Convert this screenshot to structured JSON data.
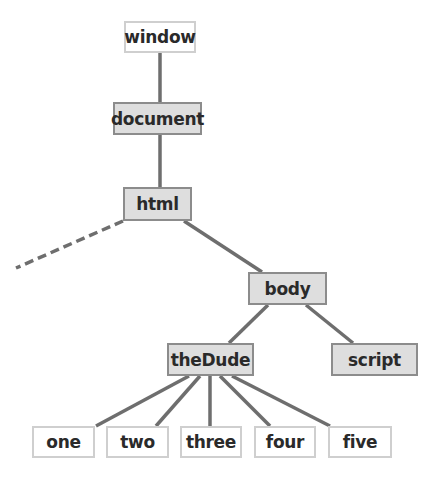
{
  "diagram": {
    "type": "tree",
    "colors": {
      "shaded_fill": "#dedede",
      "shaded_border": "#8c8c8c",
      "plain_fill": "#ffffff",
      "plain_border": "#cfcfcf",
      "edge": "#6e6e6e"
    },
    "nodes": {
      "window": {
        "label": "window",
        "style": "plain"
      },
      "document": {
        "label": "document",
        "style": "shaded"
      },
      "html": {
        "label": "html",
        "style": "shaded"
      },
      "body": {
        "label": "body",
        "style": "shaded"
      },
      "theDude": {
        "label": "theDude",
        "style": "shaded"
      },
      "script": {
        "label": "script",
        "style": "shaded"
      },
      "one": {
        "label": "one",
        "style": "plain"
      },
      "two": {
        "label": "two",
        "style": "plain"
      },
      "three": {
        "label": "three",
        "style": "plain"
      },
      "four": {
        "label": "four",
        "style": "plain"
      },
      "five": {
        "label": "five",
        "style": "plain"
      }
    },
    "edges": [
      {
        "from": "window",
        "to": "document",
        "style": "solid"
      },
      {
        "from": "document",
        "to": "html",
        "style": "solid"
      },
      {
        "from": "html",
        "to": "(offscreen)",
        "style": "dashed"
      },
      {
        "from": "html",
        "to": "body",
        "style": "solid"
      },
      {
        "from": "body",
        "to": "theDude",
        "style": "solid"
      },
      {
        "from": "body",
        "to": "script",
        "style": "solid"
      },
      {
        "from": "theDude",
        "to": "one",
        "style": "solid"
      },
      {
        "from": "theDude",
        "to": "two",
        "style": "solid"
      },
      {
        "from": "theDude",
        "to": "three",
        "style": "solid"
      },
      {
        "from": "theDude",
        "to": "four",
        "style": "solid"
      },
      {
        "from": "theDude",
        "to": "five",
        "style": "solid"
      }
    ]
  }
}
